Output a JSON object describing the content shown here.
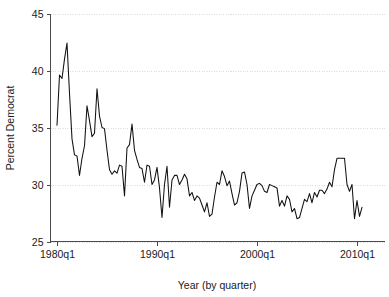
{
  "chart_data": {
    "type": "line",
    "title": "",
    "xlabel": "Year (by quarter)",
    "ylabel": "Percent Democrat",
    "ylim": [
      25,
      45
    ],
    "xlim": [
      "1980q1",
      "2010q4"
    ],
    "grid": true,
    "legend": "none",
    "ytick_labels": [
      "25",
      "30",
      "35",
      "40",
      "45"
    ],
    "ytick_values": [
      25,
      30,
      35,
      40,
      45
    ],
    "xtick_labels": [
      "1980q1",
      "1990q1",
      "2000q1",
      "2010q1"
    ],
    "xtick_values": [
      0,
      40,
      80,
      120
    ],
    "series_name": "Percent Democrat",
    "series_color": "#111111",
    "x": [
      "1980q1",
      "1980q2",
      "1980q3",
      "1980q4",
      "1981q1",
      "1981q2",
      "1981q3",
      "1981q4",
      "1982q1",
      "1982q2",
      "1982q3",
      "1982q4",
      "1983q1",
      "1983q2",
      "1983q3",
      "1983q4",
      "1984q1",
      "1984q2",
      "1984q3",
      "1984q4",
      "1985q1",
      "1985q2",
      "1985q3",
      "1985q4",
      "1986q1",
      "1986q2",
      "1986q3",
      "1986q4",
      "1987q1",
      "1987q2",
      "1987q3",
      "1987q4",
      "1988q1",
      "1988q2",
      "1988q3",
      "1988q4",
      "1989q1",
      "1989q2",
      "1989q3",
      "1989q4",
      "1990q1",
      "1990q2",
      "1990q3",
      "1990q4",
      "1991q1",
      "1991q2",
      "1991q3",
      "1991q4",
      "1992q1",
      "1992q2",
      "1992q3",
      "1992q4",
      "1993q1",
      "1993q2",
      "1993q3",
      "1993q4",
      "1994q1",
      "1994q2",
      "1994q3",
      "1994q4",
      "1995q1",
      "1995q2",
      "1995q3",
      "1995q4",
      "1996q1",
      "1996q2",
      "1996q3",
      "1996q4",
      "1997q1",
      "1997q2",
      "1997q3",
      "1997q4",
      "1998q1",
      "1998q2",
      "1998q3",
      "1998q4",
      "1999q1",
      "1999q2",
      "1999q3",
      "1999q4",
      "2000q1",
      "2000q2",
      "2000q3",
      "2000q4",
      "2001q1",
      "2001q2",
      "2001q3",
      "2001q4",
      "2002q1",
      "2002q2",
      "2002q3",
      "2002q4",
      "2003q1",
      "2003q2",
      "2003q3",
      "2003q4",
      "2004q1",
      "2004q2",
      "2004q3",
      "2004q4",
      "2005q1",
      "2005q2",
      "2005q3",
      "2005q4",
      "2006q1",
      "2006q2",
      "2006q3",
      "2006q4",
      "2007q1",
      "2007q2",
      "2007q3",
      "2007q4",
      "2008q1",
      "2008q2",
      "2008q3",
      "2008q4",
      "2009q1",
      "2009q2",
      "2009q3",
      "2009q4",
      "2010q1",
      "2010q2",
      "2010q3"
    ],
    "values": [
      35.2,
      39.6,
      39.3,
      41.0,
      42.4,
      38.0,
      34.0,
      32.6,
      32.5,
      30.8,
      32.3,
      33.4,
      36.9,
      35.6,
      34.2,
      34.5,
      38.4,
      36.0,
      35.0,
      34.9,
      33.0,
      31.3,
      30.9,
      31.2,
      31.0,
      31.7,
      31.6,
      29.0,
      33.2,
      33.5,
      35.3,
      33.0,
      32.2,
      31.5,
      31.4,
      30.2,
      31.7,
      31.6,
      30.0,
      30.4,
      31.5,
      29.7,
      27.1,
      30.0,
      31.6,
      28.0,
      30.4,
      30.8,
      30.8,
      30.0,
      30.4,
      30.9,
      30.5,
      29.0,
      29.3,
      28.6,
      29.0,
      28.8,
      28.2,
      27.6,
      28.4,
      27.2,
      27.4,
      28.9,
      30.2,
      30.0,
      31.2,
      30.7,
      29.9,
      30.3,
      29.2,
      28.2,
      28.4,
      29.4,
      31.0,
      31.1,
      30.0,
      27.9,
      29.0,
      29.5,
      30.0,
      30.1,
      29.9,
      29.4,
      29.3,
      30.0,
      29.9,
      29.8,
      29.7,
      28.1,
      28.6,
      28.1,
      29.0,
      28.7,
      27.6,
      27.9,
      27.0,
      27.1,
      27.9,
      28.7,
      28.5,
      29.2,
      28.4,
      29.3,
      28.9,
      29.5,
      29.5,
      29.2,
      29.6,
      30.2,
      29.8,
      31.3,
      32.3,
      32.3,
      32.3,
      32.3,
      30.0,
      29.4,
      30.0,
      27.0,
      28.6,
      27.2,
      28.0
    ]
  }
}
